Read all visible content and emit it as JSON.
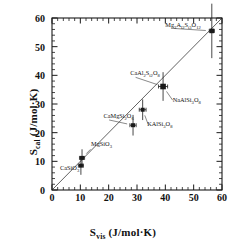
{
  "chart_data": {
    "type": "scatter",
    "title": "",
    "xlabel": "S_vis (J/mol·K)",
    "ylabel": "S_cal (J/mol·K)",
    "xlabel_parts": {
      "symbol": "S",
      "sub": "vis",
      "units": "(J/mol·K)"
    },
    "ylabel_parts": {
      "symbol": "S",
      "sub": "cal",
      "units": "(J/mol·K)"
    },
    "xlim": [
      0,
      60
    ],
    "ylim": [
      0,
      60
    ],
    "xticks": [
      0,
      10,
      20,
      30,
      40,
      50,
      60
    ],
    "yticks": [
      0,
      10,
      20,
      30,
      40,
      50,
      60
    ],
    "xminor_step": 2,
    "yminor_step": 2,
    "grid": false,
    "legend": "none",
    "reference_line": {
      "label": "1:1 line",
      "from": [
        0,
        0
      ],
      "to": [
        60,
        60
      ],
      "style": "thin-solid"
    },
    "points": [
      {
        "name": "CaSiO3",
        "label": "CaSiO",
        "sub": "3",
        "x": 10.2,
        "y": 8.5,
        "xerr": 0.9,
        "yerr": 3.2,
        "marker": "square",
        "size": 4.0,
        "label_x": 9.6,
        "label_y": 7.4,
        "label_anchor": "end",
        "leader": false
      },
      {
        "name": "MgSiO3",
        "label": "MgSiO",
        "sub": "3",
        "x": 10.6,
        "y": 11.2,
        "xerr": 0.9,
        "yerr": 3.0,
        "marker": "square",
        "size": 4.0,
        "label_x": 13.8,
        "label_y": 15.8,
        "label_anchor": "start",
        "leader": true
      },
      {
        "name": "CaMgSi2O6",
        "label": "CaMgSi",
        "sub": "2O6",
        "x": 28.6,
        "y": 22.6,
        "xerr": 1.1,
        "yerr": 3.6,
        "marker": "square",
        "size": 4.0,
        "label_x": 18.2,
        "label_y": 25.4,
        "label_anchor": "start",
        "leader": true
      },
      {
        "name": "KAlSi3O8",
        "label": "KAlSi",
        "sub": "3O8",
        "x": 32.0,
        "y": 28.0,
        "xerr": 1.2,
        "yerr": 3.6,
        "marker": "square",
        "size": 4.0,
        "label_x": 33.6,
        "label_y": 22.6,
        "label_anchor": "start",
        "leader": true
      },
      {
        "name": "CaAl2Si2O8",
        "label": "CaAl",
        "sub": "2Si2O8",
        "x": 39.2,
        "y": 36.1,
        "xerr": 1.6,
        "yerr": 5.0,
        "marker": "square",
        "size": 5.6,
        "label_x": 27.6,
        "label_y": 40.4,
        "label_anchor": "start",
        "leader": true
      },
      {
        "name": "NaAlSi3O8",
        "label": "NaAlSi",
        "sub": "3O8",
        "x": 39.2,
        "y": 36.1,
        "xerr": 1.6,
        "yerr": 5.0,
        "marker": "none",
        "size": 0,
        "label_x": 42.6,
        "label_y": 31.0,
        "label_anchor": "start",
        "leader": true
      },
      {
        "name": "Mg3Al2Si3O12",
        "label": "Mg",
        "sub": "3Al2Si3O12",
        "x": 56.4,
        "y": 55.5,
        "xerr": 0.9,
        "yerr": 9.5,
        "marker": "square",
        "size": 4.6,
        "label_x": 40.0,
        "label_y": 57.2,
        "label_anchor": "start",
        "leader": true
      }
    ]
  },
  "style": {
    "axis_color": "#1a1a1a",
    "marker_color": "#1a1a1a",
    "line_color": "#3a3a3a",
    "background": "#ffffff"
  }
}
